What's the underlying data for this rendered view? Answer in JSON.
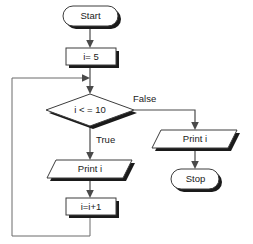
{
  "diagram": {
    "type": "flowchart",
    "colors": {
      "background": "#ffffff",
      "outline": "#3c3c3c",
      "shadow": "#1a1a1a",
      "connector": "#4a4a4a",
      "text": "#1a1a1a"
    },
    "nodes": [
      {
        "id": "start",
        "shape": "terminator",
        "label": "Start"
      },
      {
        "id": "init",
        "shape": "process",
        "label": "i= 5"
      },
      {
        "id": "decision",
        "shape": "decision",
        "label": "i < = 10"
      },
      {
        "id": "print_true",
        "shape": "parallelogram",
        "label": "Print i"
      },
      {
        "id": "increment",
        "shape": "process",
        "label": "i=i+1"
      },
      {
        "id": "print_false",
        "shape": "parallelogram",
        "label": "Print i"
      },
      {
        "id": "stop",
        "shape": "terminator",
        "label": "Stop"
      }
    ],
    "edges": [
      {
        "id": "e-start-init",
        "from": "start",
        "to": "init",
        "label": ""
      },
      {
        "id": "e-init-decision",
        "from": "init",
        "to": "decision",
        "label": ""
      },
      {
        "id": "e-decision-true",
        "from": "decision",
        "to": "print_true",
        "label": "True"
      },
      {
        "id": "e-decision-false",
        "from": "decision",
        "to": "print_false",
        "label": "False"
      },
      {
        "id": "e-print-increment",
        "from": "print_true",
        "to": "increment",
        "label": ""
      },
      {
        "id": "e-increment-loop",
        "from": "increment",
        "to": "decision",
        "label": ""
      },
      {
        "id": "e-printfalse-stop",
        "from": "print_false",
        "to": "stop",
        "label": ""
      }
    ]
  }
}
